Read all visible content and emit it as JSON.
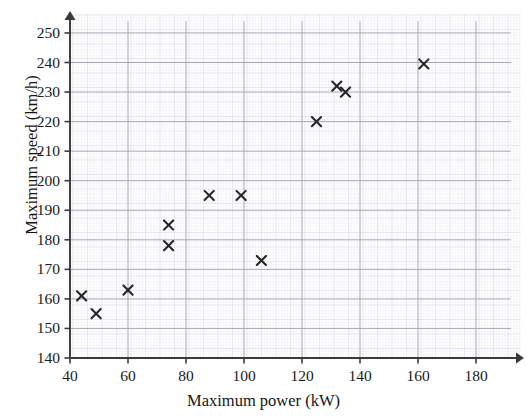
{
  "chart_data": {
    "type": "scatter",
    "title": "",
    "xlabel": "Maximum power (kW)",
    "ylabel": "Maximum speed (km/h)",
    "xlim": [
      40,
      192
    ],
    "ylim": [
      140,
      254
    ],
    "xticks": [
      40,
      60,
      80,
      100,
      120,
      140,
      160,
      180
    ],
    "yticks": [
      140,
      150,
      160,
      170,
      180,
      190,
      200,
      210,
      220,
      230,
      240,
      250
    ],
    "xtick_labels": [
      "40",
      "60",
      "80",
      "100",
      "120",
      "140",
      "160",
      "180"
    ],
    "ytick_labels": [
      "140",
      "150",
      "160",
      "170",
      "180",
      "190",
      "200",
      "210",
      "220",
      "230",
      "240",
      "250"
    ],
    "grid": true,
    "grid_minor": true,
    "legend": null,
    "marker": "x",
    "marker_color": "#262626",
    "points": [
      {
        "x": 44,
        "y": 161
      },
      {
        "x": 49,
        "y": 155
      },
      {
        "x": 60,
        "y": 163
      },
      {
        "x": 74,
        "y": 185
      },
      {
        "x": 74,
        "y": 178
      },
      {
        "x": 88,
        "y": 195
      },
      {
        "x": 99,
        "y": 195
      },
      {
        "x": 106,
        "y": 173
      },
      {
        "x": 125,
        "y": 220
      },
      {
        "x": 132,
        "y": 232
      },
      {
        "x": 135,
        "y": 230
      },
      {
        "x": 162,
        "y": 239.5
      }
    ]
  },
  "axes": {
    "x_arrow": true,
    "y_arrow": true,
    "axis_color": "#3a3a3a",
    "grid_major_color": "#a9a9b4",
    "grid_mid_color": "#c8c8d2",
    "grid_minor_color": "#e2e2ea"
  }
}
